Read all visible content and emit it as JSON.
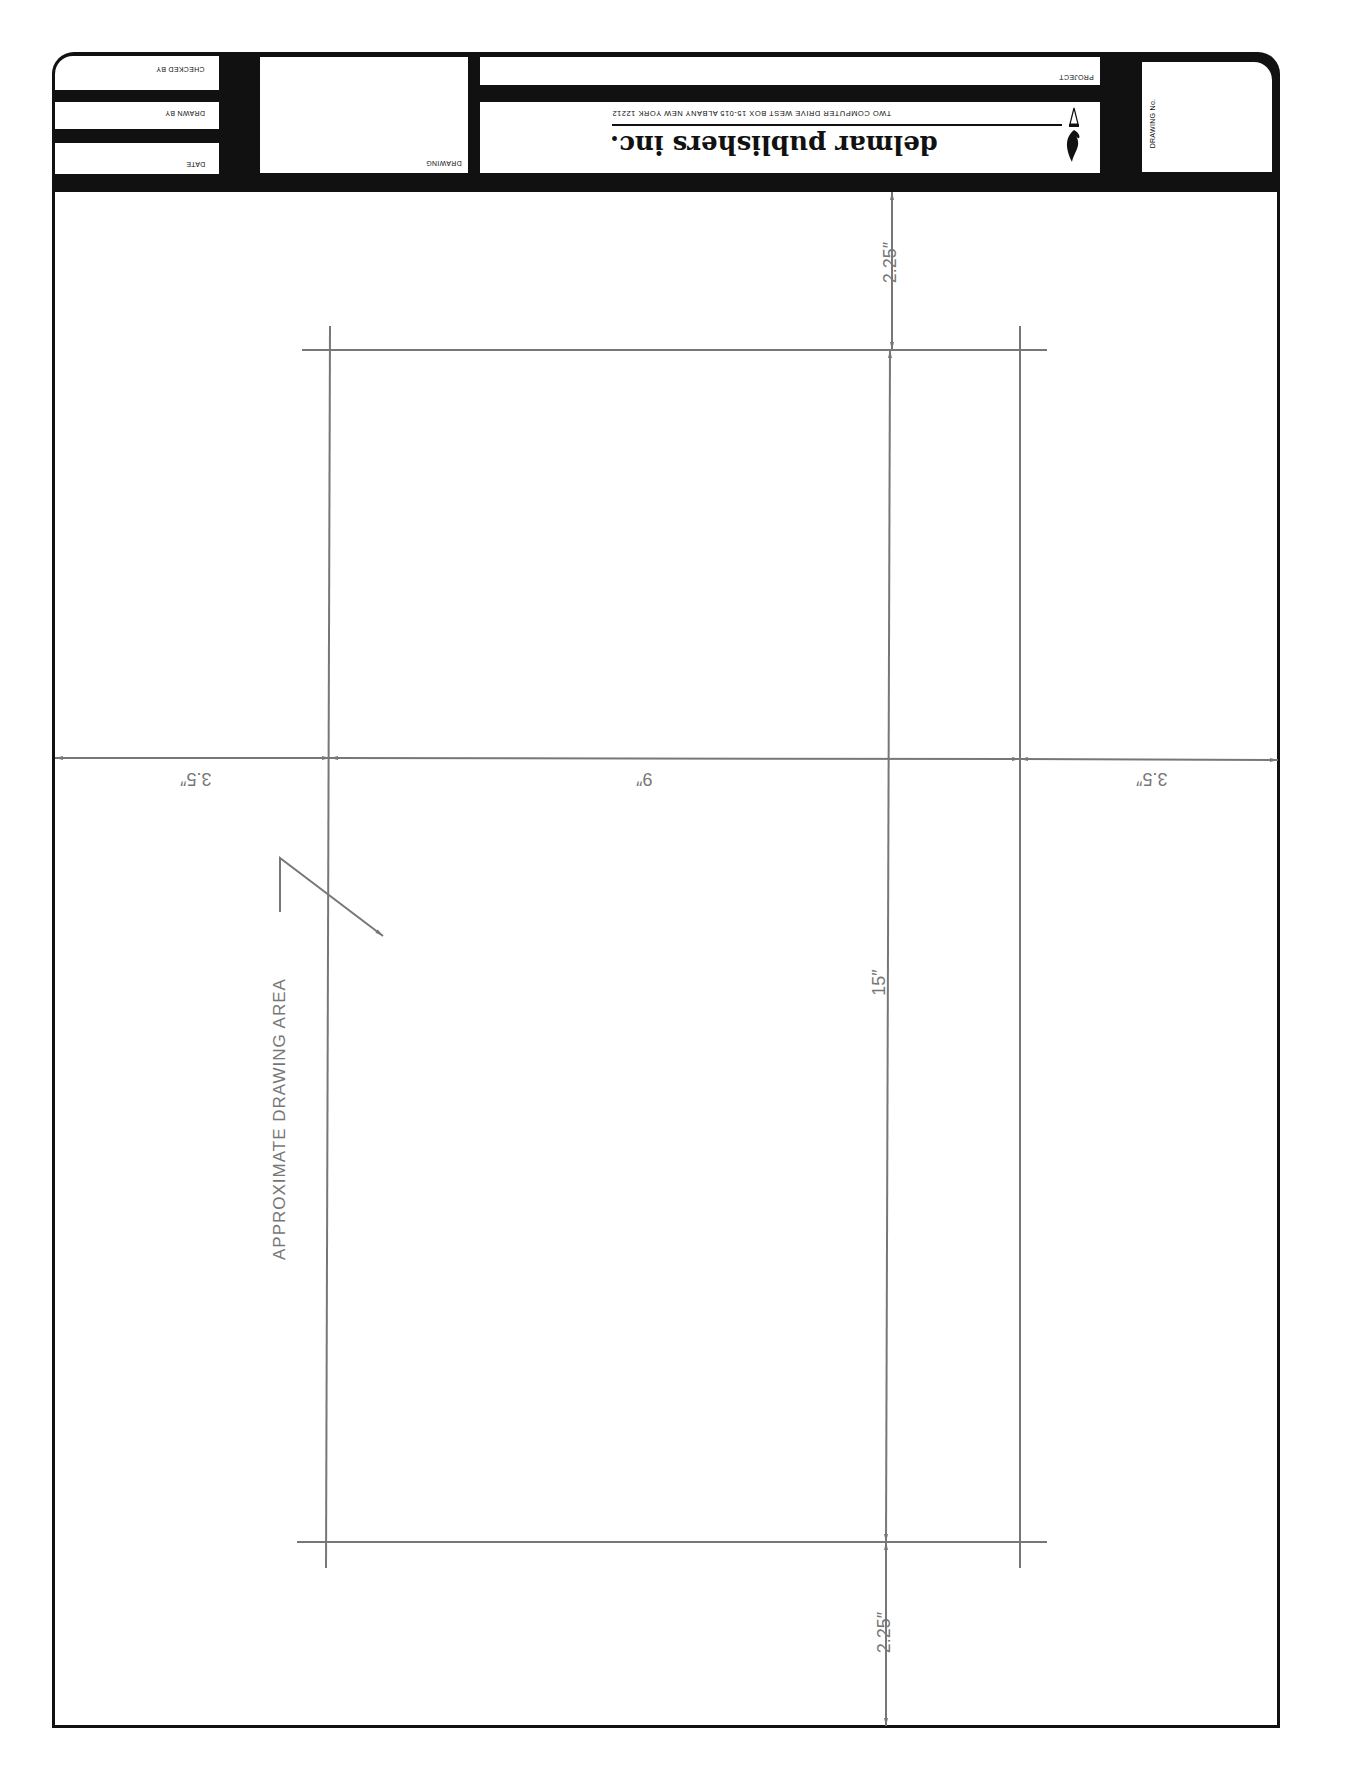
{
  "title_block": {
    "checked_by_label": "CHECKED BY",
    "drawn_by_label": "DRAWN BY",
    "date_label": "DATE",
    "drawing_label": "DRAWING",
    "project_label": "PROJECT",
    "drawing_no_label": "DRAWING No.",
    "company_name": "delmar publishers inc.",
    "company_address": "TWO COMPUTER DRIVE WEST  BOX 15-015  ALBANY  NEW YORK  12212",
    "logo_icon": "pen-nib-flame-icon"
  },
  "dimensions": {
    "top_margin": "2.25″",
    "bottom_margin": "2.25″",
    "left_margin": "3.5″",
    "right_margin": "3.5″",
    "width": "9″",
    "height": "15″"
  },
  "annotation": {
    "label": "APPROXIMATE DRAWING AREA"
  },
  "colors": {
    "ink": "#111111",
    "dimension_gray": "#777777",
    "paper": "#ffffff"
  }
}
